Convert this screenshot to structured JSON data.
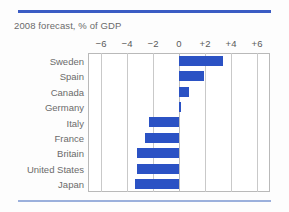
{
  "chart_data": {
    "type": "bar",
    "orientation": "horizontal",
    "title": "2008 forecast, % of GDP",
    "xlabel": "",
    "ylabel": "",
    "xlim": [
      -7,
      7
    ],
    "xticks": [
      -6,
      -4,
      -2,
      0,
      2,
      4,
      6
    ],
    "xtick_labels": [
      "−6",
      "−4",
      "−2",
      "0",
      "+2",
      "+4",
      "+6"
    ],
    "grid": true,
    "legend": "none",
    "bar_color": "#2b52c4",
    "categories": [
      "Sweden",
      "Spain",
      "Canada",
      "Germany",
      "Italy",
      "France",
      "Britain",
      "United States",
      "Japan"
    ],
    "values": [
      3.4,
      1.9,
      0.8,
      0.1,
      -2.3,
      -2.6,
      -3.2,
      -3.2,
      -3.4
    ]
  },
  "decor": {
    "rule_top_color": "#3b5cc4",
    "rule_bottom_color": "#9bb0dc"
  }
}
